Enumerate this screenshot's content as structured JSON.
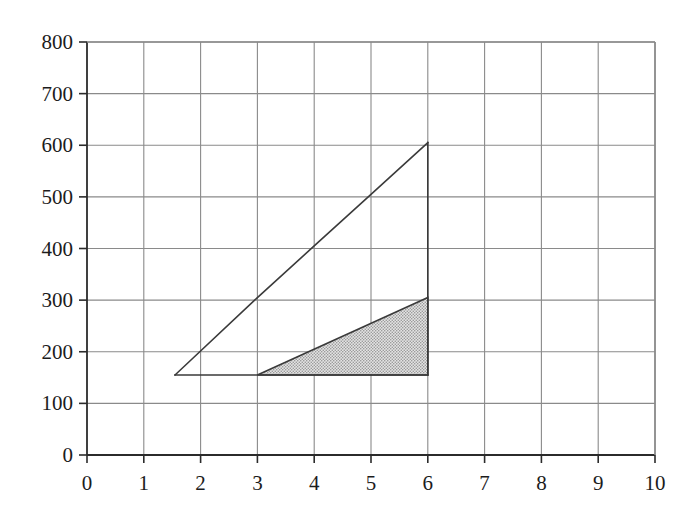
{
  "chart_data": {
    "type": "line",
    "title": "",
    "xlabel": "",
    "ylabel": "",
    "xlim": [
      0,
      10
    ],
    "ylim": [
      0,
      800
    ],
    "grid": true,
    "legend": null,
    "x_ticks": [
      0,
      1,
      2,
      3,
      4,
      5,
      6,
      7,
      8,
      9,
      10
    ],
    "y_ticks": [
      0,
      100,
      200,
      300,
      400,
      500,
      600,
      700,
      800
    ],
    "x_tick_labels": [
      "0",
      "1",
      "2",
      "3",
      "4",
      "5",
      "6",
      "7",
      "8",
      "9",
      "10"
    ],
    "y_tick_labels": [
      "0",
      "100",
      "200",
      "300",
      "400",
      "500",
      "600",
      "700",
      "800"
    ],
    "series": [
      {
        "name": "upper-line",
        "type": "line",
        "points": [
          [
            1.55,
            155
          ],
          [
            3,
            305
          ],
          [
            4,
            405
          ],
          [
            5,
            505
          ],
          [
            6,
            605
          ]
        ],
        "color": "#3a3a3a",
        "width": 1.6
      },
      {
        "name": "baseline",
        "type": "line",
        "points": [
          [
            1.55,
            155
          ],
          [
            3,
            155
          ],
          [
            6,
            155
          ]
        ],
        "color": "#3a3a3a",
        "width": 1.6
      },
      {
        "name": "right-vertical",
        "type": "line",
        "points": [
          [
            6,
            155
          ],
          [
            6,
            605
          ]
        ],
        "color": "#3a3a3a",
        "width": 1.6
      }
    ],
    "shaded_regions": [
      {
        "name": "shaded-triangle",
        "vertices": [
          [
            3,
            155
          ],
          [
            6,
            155
          ],
          [
            6,
            305
          ]
        ],
        "fill": "#c9c9c9",
        "pattern": "stipple",
        "edge": "#3a3a3a"
      }
    ],
    "colors": {
      "grid": "#8a8a8a",
      "axis": "#2b2b2b",
      "line": "#3a3a3a",
      "shade": "#c9c9c9",
      "background": "#ffffff"
    }
  }
}
